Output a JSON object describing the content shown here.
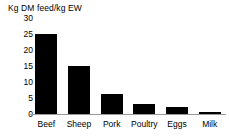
{
  "chart_data": {
    "type": "bar",
    "title": "",
    "ylabel": "Kg DM feed/kg EW",
    "xlabel": "",
    "categories": [
      "Beef",
      "Sheep",
      "Pork",
      "Poultry",
      "Eggs",
      "Milk"
    ],
    "values": [
      25,
      15,
      6.4,
      3.2,
      2.3,
      0.6
    ],
    "ylim": [
      0,
      30
    ],
    "yticks": [
      30,
      25,
      20,
      15,
      10,
      5,
      0
    ],
    "ytick_labels": [
      "30",
      "25",
      "20",
      "15",
      "10",
      "5",
      "0"
    ],
    "grid": false,
    "legend": false,
    "legend_position": "none",
    "bar_color": "#000000",
    "axis_color": "#9a9a9a",
    "background_color": "#ffffff"
  }
}
